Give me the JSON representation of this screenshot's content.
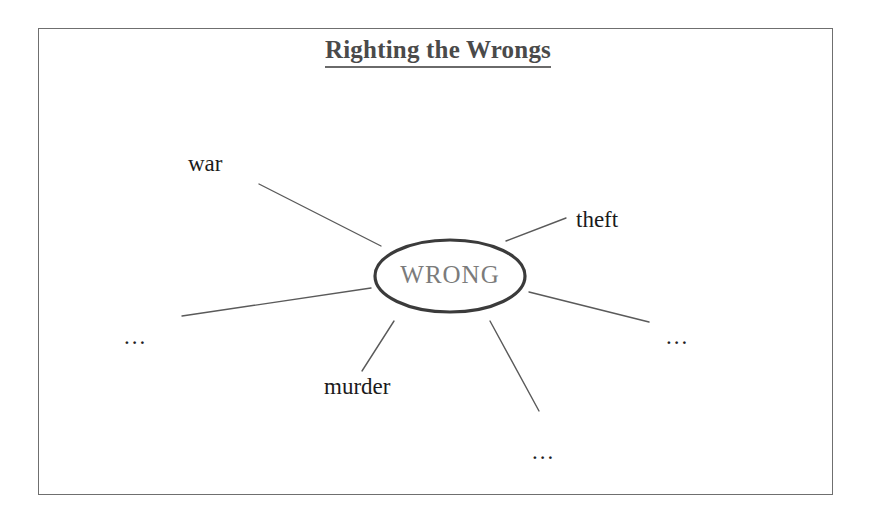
{
  "diagram": {
    "title": "Righting the Wrongs",
    "type": "spider-web-concept-map",
    "center_node": {
      "label": "WRONG",
      "shape": "ellipse",
      "stroke_color": "#3b3b3b",
      "text_color": "#7b7b7b"
    },
    "frame": {
      "stroke_color": "#6f6f6f"
    },
    "spoke_color": "#5a5a5a",
    "nodes": [
      {
        "id": "war",
        "label": "war",
        "position": "upper-left"
      },
      {
        "id": "theft",
        "label": "theft",
        "position": "upper-right"
      },
      {
        "id": "murder",
        "label": "murder",
        "position": "lower-left-bottom"
      },
      {
        "id": "dots-left",
        "label": "...",
        "position": "left"
      },
      {
        "id": "dots-right",
        "label": "...",
        "position": "right"
      },
      {
        "id": "dots-bottom",
        "label": "...",
        "position": "bottom-right"
      }
    ]
  }
}
